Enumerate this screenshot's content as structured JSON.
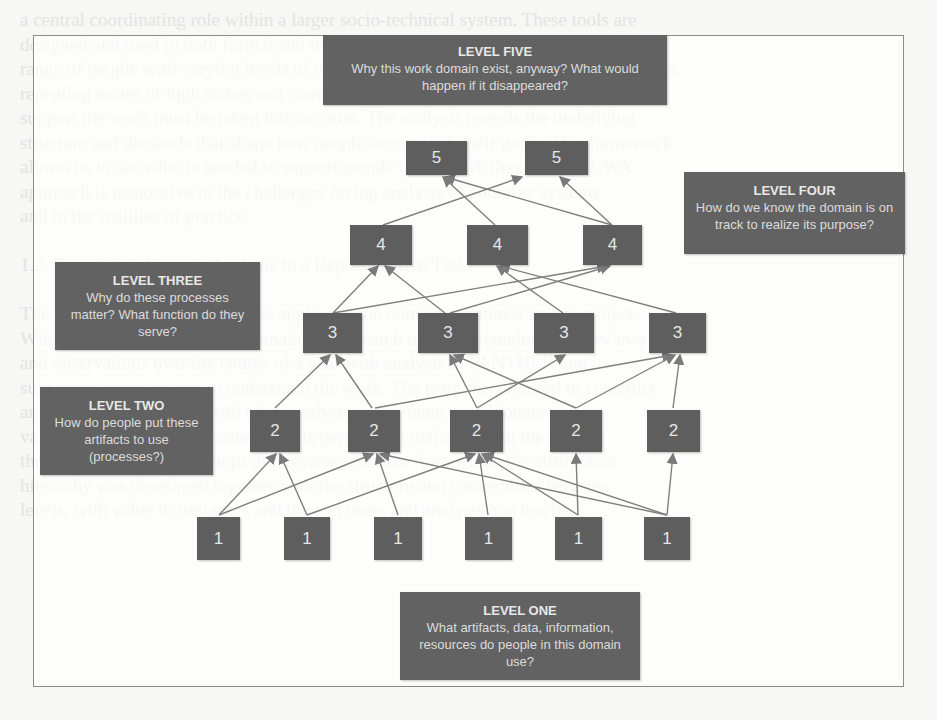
{
  "diagram": {
    "type": "abstraction-hierarchy",
    "levels": [
      {
        "id": 5,
        "title": "LEVEL FIVE",
        "question": "Why this work domain exist, anyway? What would happen if it disappeared?",
        "node_label": "5",
        "node_count": 2
      },
      {
        "id": 4,
        "title": "LEVEL FOUR",
        "question": "How do we know the domain is on track to realize its purpose?",
        "node_label": "4",
        "node_count": 3
      },
      {
        "id": 3,
        "title": "LEVEL THREE",
        "question": "Why do these processes matter? What function do they serve?",
        "node_label": "3",
        "node_count": 4
      },
      {
        "id": 2,
        "title": "LEVEL TWO",
        "question": "How do people put these artifacts to use (processes?)",
        "node_label": "2",
        "node_count": 5
      },
      {
        "id": 1,
        "title": "LEVEL ONE",
        "question": "What artifacts, data, information, resources do people in this domain use?",
        "node_label": "1",
        "node_count": 6
      }
    ],
    "nodes": {
      "l5": [
        "5",
        "5"
      ],
      "l4": [
        "4",
        "4",
        "4"
      ],
      "l3": [
        "3",
        "3",
        "3",
        "3"
      ],
      "l2": [
        "2",
        "2",
        "2",
        "2",
        "2"
      ],
      "l1": [
        "1",
        "1",
        "1",
        "1",
        "1",
        "1"
      ]
    },
    "edges_note": "Arrows point upward from each lower-level node to the higher-level nodes it supports",
    "colors": {
      "box_fill": "#5e5e5e",
      "box_text": "#e6e6e6",
      "arrow": "#7a7a7a",
      "frame": "#8a8a8a"
    }
  },
  "background_text": "a central coordinating role within a larger socio-technical system. These tools are\ndesigned and used in both formal and informal settings, and they are used by a wide\nrange of people with varying levels of expertise. Because the work domain is complex,\nrepeating issues of high stakes and complexity arise, and the needs of those who\nsupport the work must be taken into account. The analysis reveals the underlying\nstructure and demands that shape how people accomplish their goals. This framework\nallows us to see what is needed to support people in the work they do. The CWA\napproach is responsive to the challenges facing analysts of complex systems\nand to the realities of practice.\n\n1.2  From Work Domain Analysis to a Representative Task\n\nThe process described above was applied to the domain of interest in this project.\nWhen investigating the work domain, the research team first conducted interviews\nand observations over the course of a year with analysts in PANTHER and its\nsupporting environment to understand the work. The team then worked to construct\nan abstraction hierarchy with other analysts and domain practitioners and\nvalidated it with subject matter experts performing major roles in the domain\nthrough a series of workshops and review sessions, from which the abstraction\nhierarchy was developed together with the structure and connections between\nlevels, with value to designers and the end users and analysts and teachers."
}
